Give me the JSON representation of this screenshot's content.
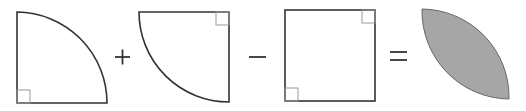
{
  "diagram": {
    "operators": {
      "plus": "+",
      "minus": "−",
      "equals": "="
    },
    "shapes": [
      {
        "id": "quarter-circle-1",
        "kind": "quarter-circle",
        "right_angle_corner": "bottom-left"
      },
      {
        "id": "quarter-circle-2",
        "kind": "quarter-circle",
        "right_angle_corner": "top-right"
      },
      {
        "id": "square",
        "kind": "square",
        "right_angle_corners": [
          "top-right",
          "bottom-left"
        ]
      },
      {
        "id": "lens",
        "kind": "lens",
        "fill": "#a6a6a6"
      }
    ],
    "colors": {
      "stroke": "#333333",
      "marker": "#999999",
      "shade": "#a6a6a6"
    }
  }
}
